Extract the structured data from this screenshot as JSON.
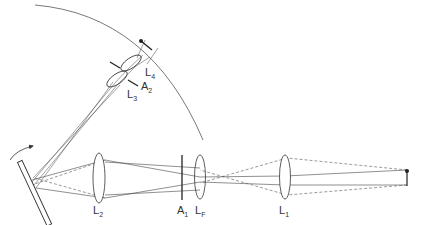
{
  "diagram": {
    "type": "optical-ray-diagram",
    "colors": {
      "stroke": "#333333",
      "ray": "#555555",
      "background": "#ffffff"
    },
    "labels": {
      "L1": {
        "main": "L",
        "sub": "1"
      },
      "LF": {
        "main": "L",
        "sub": "F"
      },
      "A1": {
        "main": "A",
        "sub": "1"
      },
      "L2": {
        "main": "L",
        "sub": "2"
      },
      "L3": {
        "main": "L",
        "sub": "3"
      },
      "A2": {
        "main": "A",
        "sub": "2"
      },
      "L4": {
        "main": "L",
        "sub": "4"
      }
    },
    "components": [
      {
        "id": "object",
        "name": "object point source (right)"
      },
      {
        "id": "L1",
        "name": "lens L1"
      },
      {
        "id": "LF",
        "name": "field lens LF"
      },
      {
        "id": "A1",
        "name": "aperture A1"
      },
      {
        "id": "L2",
        "name": "lens L2"
      },
      {
        "id": "mirror",
        "name": "scanning mirror with rotation arrow"
      },
      {
        "id": "L3",
        "name": "lens L3"
      },
      {
        "id": "A2",
        "name": "aperture A2"
      },
      {
        "id": "L4",
        "name": "lens L4"
      },
      {
        "id": "image-arc",
        "name": "curved image surface"
      }
    ]
  }
}
